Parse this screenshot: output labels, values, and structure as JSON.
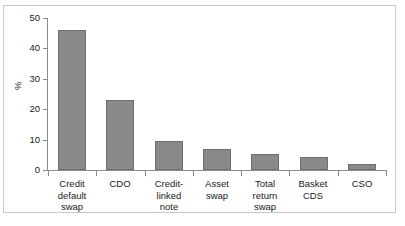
{
  "chart_data": {
    "type": "bar",
    "title": "",
    "xlabel": "",
    "ylabel": "%",
    "ylim": [
      0,
      50
    ],
    "yticks": [
      0,
      10,
      20,
      30,
      40,
      50
    ],
    "grid": false,
    "legend": false,
    "categories": [
      "Credit default swap",
      "CDO",
      "Credit-linked note",
      "Asset swap",
      "Total return swap",
      "Basket CDS",
      "CSO"
    ],
    "category_label_lines": [
      [
        "Credit",
        "default",
        "swap"
      ],
      [
        "CDO"
      ],
      [
        "Credit-",
        "linked",
        "note"
      ],
      [
        "Asset",
        "swap"
      ],
      [
        "Total",
        "return",
        "swap"
      ],
      [
        "Basket",
        "CDS"
      ],
      [
        "CSO"
      ]
    ],
    "values": [
      46,
      23,
      9.7,
      7,
      5.4,
      4.3,
      2
    ],
    "bar_color": "#8a8a8a",
    "bar_edge_color": "#6e6e6e",
    "axis_color": "#8c8c8c",
    "frame_color": "#c8c8c8",
    "text_color": "#1a1a1a"
  }
}
